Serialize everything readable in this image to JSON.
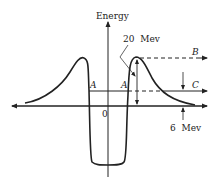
{
  "diagram": {
    "y_axis_label": "Energy",
    "origin_label": "0",
    "labels": {
      "a_left": "A",
      "a_right": "A",
      "b": "B",
      "c": "C",
      "barrier_height": "20  Mev",
      "level_c": "6  Mev"
    },
    "colors": {
      "stroke": "#222222",
      "background": "#ffffff"
    }
  }
}
